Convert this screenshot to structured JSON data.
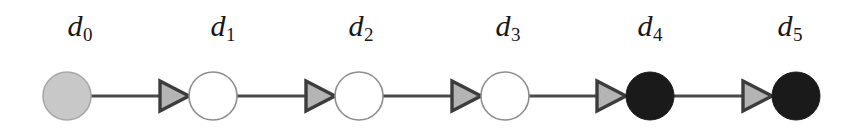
{
  "figure": {
    "kind": "directed-chain-graph",
    "width": 844,
    "height": 136,
    "background": "#ffffff"
  },
  "style": {
    "edge_color": "#4a4a4a",
    "edge_width": 3,
    "node_outline_color": "#8d8d8d",
    "node_outline_width": 1.6,
    "arrow_outline_color": "#3c3c3c",
    "arrow_fill_color": "#b4b4b4",
    "label_color": "#171717",
    "fill_unvisited": "#ffffff",
    "fill_gray": "#c8c8c8",
    "fill_black": "#1a1a1a",
    "node_radius": 24,
    "baseline_y": 96,
    "label_y": 28
  },
  "nodes": [
    {
      "id": "d0",
      "letter": "d",
      "subscript": "0",
      "cx": 67,
      "cy": 96,
      "r": 24,
      "state": "gray",
      "fill": "#c8c8c8",
      "outline": "#a8a8a8",
      "label_x": 80,
      "label_y": 28
    },
    {
      "id": "d1",
      "letter": "d",
      "subscript": "1",
      "cx": 213,
      "cy": 96,
      "r": 24,
      "state": "white",
      "fill": "#ffffff",
      "outline": "#8d8d8d",
      "label_x": 223,
      "label_y": 28
    },
    {
      "id": "d2",
      "letter": "d",
      "subscript": "2",
      "cx": 359,
      "cy": 96,
      "r": 24,
      "state": "white",
      "fill": "#ffffff",
      "outline": "#8d8d8d",
      "label_x": 361,
      "label_y": 28
    },
    {
      "id": "d3",
      "letter": "d",
      "subscript": "3",
      "cx": 505,
      "cy": 96,
      "r": 24,
      "state": "white",
      "fill": "#ffffff",
      "outline": "#8d8d8d",
      "label_x": 508,
      "label_y": 28
    },
    {
      "id": "d4",
      "letter": "d",
      "subscript": "4",
      "cx": 650,
      "cy": 96,
      "r": 24,
      "state": "black",
      "fill": "#1a1a1a",
      "outline": "#1a1a1a",
      "label_x": 650,
      "label_y": 28
    },
    {
      "id": "d5",
      "letter": "d",
      "subscript": "5",
      "cx": 796,
      "cy": 96,
      "r": 24,
      "state": "black",
      "fill": "#1a1a1a",
      "outline": "#1a1a1a",
      "label_x": 790,
      "label_y": 28
    }
  ],
  "edges": [
    {
      "id": "e0",
      "from": "d0",
      "to": "d1",
      "line_x1": 91,
      "line_x2": 189,
      "y": 96,
      "arrow_tip_x": 189,
      "arrow_back_x": 160
    },
    {
      "id": "e1",
      "from": "d1",
      "to": "d2",
      "line_x1": 237,
      "line_x2": 335,
      "y": 96,
      "arrow_tip_x": 335,
      "arrow_back_x": 306
    },
    {
      "id": "e2",
      "from": "d2",
      "to": "d3",
      "line_x1": 383,
      "line_x2": 481,
      "y": 96,
      "arrow_tip_x": 481,
      "arrow_back_x": 452
    },
    {
      "id": "e3",
      "from": "d3",
      "to": "d4",
      "line_x1": 529,
      "line_x2": 626,
      "y": 96,
      "arrow_tip_x": 626,
      "arrow_back_x": 597
    },
    {
      "id": "e4",
      "from": "d4",
      "to": "d5",
      "line_x1": 674,
      "line_x2": 772,
      "y": 96,
      "arrow_tip_x": 772,
      "arrow_back_x": 743
    }
  ]
}
